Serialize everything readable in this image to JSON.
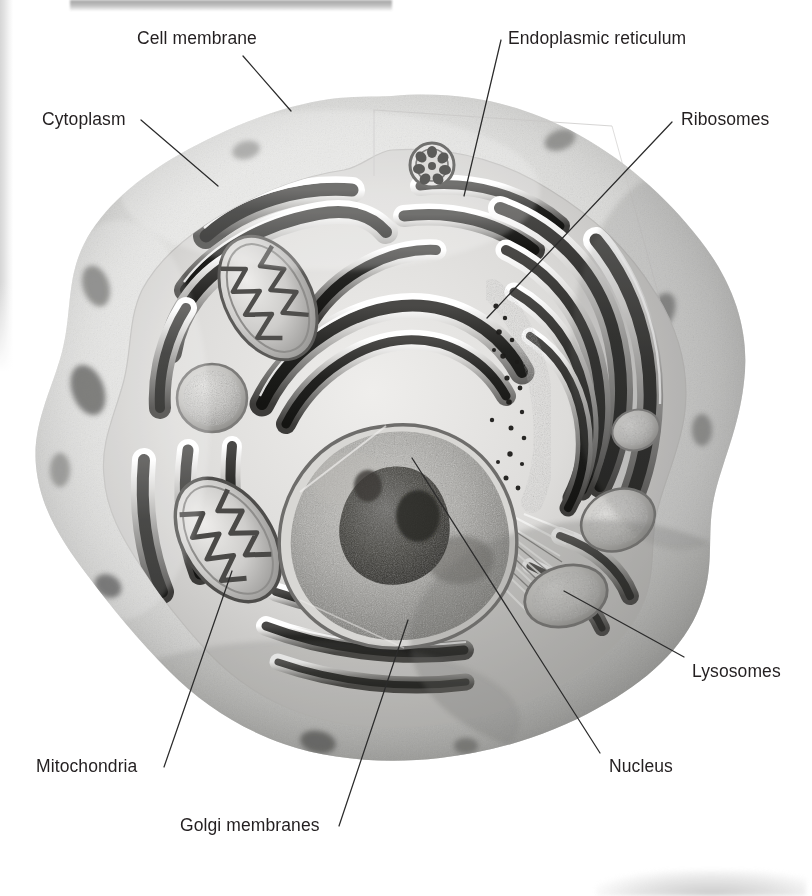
{
  "figure": {
    "type": "labeled-diagram",
    "style": "grayscale airbrush illustration",
    "background_color": "#ffffff",
    "text_color": "#231f20",
    "leader_line_color": "#2b2b2b"
  },
  "labels": [
    {
      "id": "cell-membrane",
      "text": "Cell membrane",
      "x": 137,
      "y": 30,
      "anchor": "start"
    },
    {
      "id": "cytoplasm",
      "text": "Cytoplasm",
      "x": 42,
      "y": 111,
      "anchor": "start"
    },
    {
      "id": "endoplasmic-reticulum",
      "text": "Endoplasmic reticulum",
      "x": 508,
      "y": 30,
      "anchor": "start"
    },
    {
      "id": "ribosomes",
      "text": "Ribosomes",
      "x": 681,
      "y": 111,
      "anchor": "start"
    },
    {
      "id": "lysosomes",
      "text": "Lysosomes",
      "x": 692,
      "y": 663,
      "anchor": "start"
    },
    {
      "id": "nucleus",
      "text": "Nucleus",
      "x": 609,
      "y": 758,
      "anchor": "start"
    },
    {
      "id": "mitochondria",
      "text": "Mitochondria",
      "x": 36,
      "y": 758,
      "anchor": "start"
    },
    {
      "id": "golgi-membranes",
      "text": "Golgi membranes",
      "x": 180,
      "y": 817,
      "anchor": "start"
    }
  ],
  "leader_lines": [
    {
      "id": "leader-cell-membrane",
      "from": [
        243,
        56
      ],
      "to": [
        291,
        111
      ]
    },
    {
      "id": "leader-cytoplasm",
      "from": [
        141,
        120
      ],
      "to": [
        218,
        186
      ]
    },
    {
      "id": "leader-endoplasmic-reticulum",
      "from": [
        501,
        40
      ],
      "to": [
        464,
        196
      ]
    },
    {
      "id": "leader-ribosomes",
      "from": [
        672,
        122
      ],
      "to": [
        487,
        318
      ]
    },
    {
      "id": "leader-lysosomes",
      "from": [
        564,
        591
      ],
      "to": [
        684,
        657
      ]
    },
    {
      "id": "leader-nucleus",
      "from": [
        412,
        458
      ],
      "to": [
        600,
        753
      ]
    },
    {
      "id": "leader-mitochondria",
      "from": [
        232,
        571
      ],
      "to": [
        164,
        767
      ]
    },
    {
      "id": "leader-golgi-membranes",
      "from": [
        408,
        620
      ],
      "to": [
        339,
        826
      ]
    }
  ],
  "organelle_names": [
    "cell-membrane",
    "cytoplasm",
    "endoplasmic-reticulum",
    "ribosomes",
    "lysosomes",
    "nucleus",
    "mitochondria",
    "golgi-membranes"
  ]
}
